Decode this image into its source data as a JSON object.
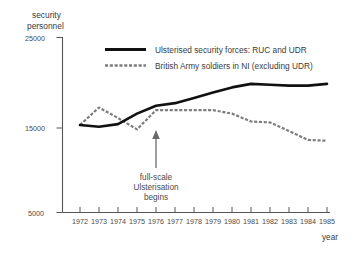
{
  "chart_data": {
    "type": "line",
    "title": "",
    "ylabel": "security personnel",
    "xlabel": "year",
    "grid": false,
    "legend_position": "top-center",
    "xlim": [
      1972,
      1985
    ],
    "ylim": [
      5000,
      25000
    ],
    "yticks": [
      5000,
      15000,
      25000
    ],
    "ytick_labels": [
      "5000",
      "15000",
      "25000"
    ],
    "categories": [
      1972,
      1973,
      1974,
      1975,
      1976,
      1977,
      1978,
      1979,
      1980,
      1981,
      1982,
      1983,
      1984,
      1985
    ],
    "xtick_labels": [
      "1972",
      "1973",
      "1974",
      "1975",
      "1976",
      "1977",
      "1978",
      "1979",
      "1980",
      "1981",
      "1982",
      "1983",
      "1984",
      "1985"
    ],
    "series": [
      {
        "name": "Ulsterised security forces: RUC and UDR",
        "style": "solid",
        "color": "#111111",
        "values": [
          15000,
          14800,
          15100,
          16300,
          17200,
          17500,
          18100,
          18700,
          19300,
          19700,
          19600,
          19500,
          19500,
          19700
        ]
      },
      {
        "name": "British Army soldiers in NI (excluding UDR)",
        "style": "dotted",
        "color": "#7d7d7d",
        "values": [
          15000,
          17000,
          15800,
          14500,
          16700,
          16700,
          16700,
          16700,
          16300,
          15400,
          15300,
          14300,
          13300,
          13200
        ]
      }
    ],
    "annotations": [
      {
        "text_lines": [
          "full-scale",
          "Ulsterisation",
          "begins"
        ],
        "points_to_year": 1976,
        "points_to_value": 15600
      }
    ]
  },
  "axis": {
    "y_title_line1": "security",
    "y_title_line2": "personnel",
    "x_title": "year"
  },
  "legend": {
    "items": [
      {
        "label": "Ulsterised security forces: RUC and UDR",
        "style": "solid"
      },
      {
        "label": "British Army soldiers in NI (excluding UDR)",
        "style": "dotted"
      }
    ]
  },
  "annotation": {
    "line1": "full-scale",
    "line2": "Ulsterisation",
    "line3": "begins"
  },
  "colors": {
    "series_solid": "#111111",
    "series_dotted": "#7d7d7d",
    "axis": "#555555",
    "text": "#3a3a3a",
    "background": "#ffffff"
  }
}
